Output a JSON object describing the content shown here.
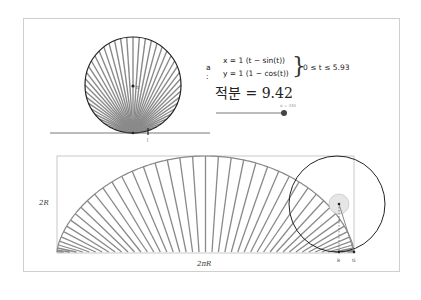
{
  "top_panel": {
    "curve_name": "a :",
    "eq_x": "x = 1 (t − sin(t))",
    "eq_y": "y = 1 (1 − cos(t))",
    "brace": "}",
    "param_range": "0 ≤ t ≤ 5.93",
    "integral_text": "적분 = 9.42",
    "slider_label": "α = 340",
    "point_center_label": "D",
    "point_contact_label": "J"
  },
  "bottom_panel": {
    "height_label": "2R",
    "width_label": "2πR",
    "point_b_label": "B",
    "point_g_label": "G"
  },
  "colors": {
    "spoke": "#8a8a8a",
    "circle": "#222222",
    "frame": "#cfcfcf",
    "fill_dense": "#9a9a9a",
    "slider_track": "#555555",
    "slider_knob": "#444444",
    "small_circle_fill": "#e6e6e6"
  }
}
